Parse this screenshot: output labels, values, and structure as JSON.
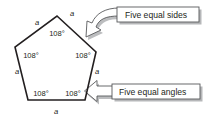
{
  "figure": {
    "shape": "pentagon",
    "stroke_color": "#231f20",
    "background_color": "#ffffff"
  },
  "polygon": {
    "name": "regular-pentagon",
    "vertices": [
      {
        "id": "top",
        "x": 57,
        "y": 16
      },
      {
        "id": "right",
        "x": 96,
        "y": 52
      },
      {
        "id": "bottom-right",
        "x": 85,
        "y": 100
      },
      {
        "id": "bottom-left",
        "x": 28,
        "y": 100
      },
      {
        "id": "left",
        "x": 15,
        "y": 47
      }
    ]
  },
  "side_labels": [
    {
      "id": "side-top-right",
      "text": "a",
      "x": 72,
      "y": 16
    },
    {
      "id": "side-top-left",
      "text": "a",
      "x": 37,
      "y": 25
    },
    {
      "id": "side-left",
      "text": "a",
      "x": 17,
      "y": 74
    },
    {
      "id": "side-bottom",
      "text": "a",
      "x": 56,
      "y": 114
    },
    {
      "id": "side-right",
      "text": "a",
      "x": 97,
      "y": 74
    }
  ],
  "angle_labels": [
    {
      "id": "angle-top",
      "text": "108°",
      "x": 57,
      "y": 36
    },
    {
      "id": "angle-left",
      "text": "108°",
      "x": 31,
      "y": 58
    },
    {
      "id": "angle-right",
      "text": "108°",
      "x": 83,
      "y": 58
    },
    {
      "id": "angle-bottom-left",
      "text": "108°",
      "x": 41,
      "y": 96
    },
    {
      "id": "angle-bottom-right",
      "text": "108°",
      "x": 73,
      "y": 96
    }
  ],
  "callouts": [
    {
      "id": "sides-callout",
      "label": "Five equal sides",
      "arrow_type": "curved-block-arrow",
      "arrow_direction": "down-left",
      "box": {
        "x": 117,
        "y": 7,
        "width": 82,
        "height": 15
      }
    },
    {
      "id": "angles-callout",
      "label": "Five equal angles",
      "arrow_type": "straight-block-arrow",
      "arrow_direction": "left",
      "box": {
        "x": 112,
        "y": 84,
        "width": 88,
        "height": 15
      }
    }
  ],
  "colors": {
    "outline": "#231f20",
    "callout_border": "#58595b",
    "shadow": "#b6b7b9",
    "fill": "#ffffff"
  }
}
